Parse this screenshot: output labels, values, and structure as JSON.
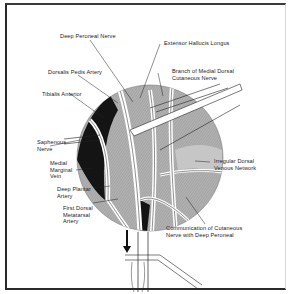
{
  "figure": {
    "labels": [
      {
        "id": "deep-peroneal-nerve",
        "text": [
          "Deep Peroneal Nerve"
        ]
      },
      {
        "id": "extensor-hallucis-longus",
        "text": [
          "Extensor Hallucis Longus"
        ]
      },
      {
        "id": "dorsalis-pedis-artery",
        "text": [
          "Dorsalis Pedis Artery"
        ]
      },
      {
        "id": "branch-medial-dorsal-cutaneous-nerve",
        "text": [
          "Branch of Medial Dorsal",
          "Cutaneous Nerve"
        ]
      },
      {
        "id": "tibialis-anterior",
        "text": [
          "Tibialis Anterior"
        ]
      },
      {
        "id": "saphenous-nerve",
        "text": [
          "Saphenous",
          "Nerve"
        ]
      },
      {
        "id": "medial-marginal-vein",
        "text": [
          "Medial",
          "Marginal",
          "Vein"
        ]
      },
      {
        "id": "irregular-dorsal-venous-network",
        "text": [
          "Irregular Dorsal",
          "Venous Network"
        ]
      },
      {
        "id": "deep-plantar-artery",
        "text": [
          "Deep Plantar",
          "Artery"
        ]
      },
      {
        "id": "first-dorsal-metatarsal-artery",
        "text": [
          "First Dorsal",
          "Metatarsal",
          "Artery"
        ]
      },
      {
        "id": "communication-cutaneous-deep-peroneal",
        "text": [
          "Communication of Cutaneous",
          "Nerve with Deep Peroneal"
        ]
      }
    ]
  },
  "colors": {
    "line": "#1e1e1e",
    "shade": "#9a9a9a",
    "dark": "#111111",
    "background": "#ffffff"
  }
}
